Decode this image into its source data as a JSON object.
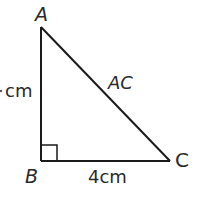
{
  "diagram": {
    "type": "right-triangle",
    "vertices": {
      "A": {
        "label": "A"
      },
      "B": {
        "label": "B"
      },
      "C": {
        "label": "C"
      }
    },
    "right_angle_at": "B",
    "sides": {
      "AB": {
        "label": "cm",
        "note": "leading value clipped at left edge"
      },
      "BC": {
        "label": "4cm"
      },
      "AC": {
        "label": "AC"
      }
    },
    "colors": {
      "line": "#1a1a1a",
      "text": "#2a2a2a",
      "background": "#ffffff"
    }
  }
}
